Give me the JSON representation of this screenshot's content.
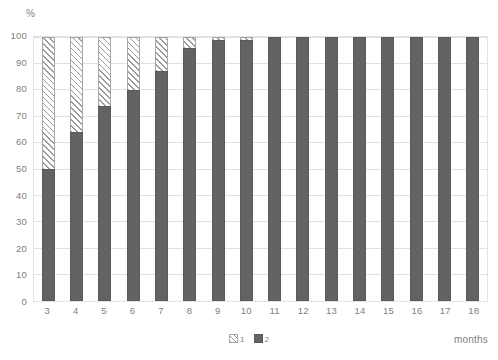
{
  "chart_data": {
    "type": "bar",
    "subtype": "stacked-100-percent",
    "title": "",
    "subtitle": "",
    "xlabel": "months",
    "ylabel": "%",
    "ylim": [
      0,
      100
    ],
    "yticks": [
      0,
      10,
      20,
      30,
      40,
      50,
      60,
      70,
      80,
      90,
      100
    ],
    "ytick_labels": [
      "0",
      "10",
      "20",
      "30",
      "40",
      "50",
      "60",
      "70",
      "80",
      "90",
      "100"
    ],
    "grid": "horizontal",
    "legend_position": "bottom-center",
    "categories": [
      "3",
      "4",
      "5",
      "6",
      "7",
      "8",
      "9",
      "10",
      "11",
      "12",
      "13",
      "14",
      "15",
      "16",
      "17",
      "18"
    ],
    "series": [
      {
        "name": "2",
        "style": "solid",
        "color": "#636363",
        "values": [
          50,
          64,
          74,
          80,
          87,
          96,
          99,
          99,
          100,
          100,
          100,
          100,
          100,
          100,
          100,
          100
        ]
      },
      {
        "name": "1",
        "style": "diagonal-hatch",
        "color": "#ffffff",
        "hatch_color": "#9a9a9a",
        "values": [
          50,
          36,
          26,
          20,
          13,
          4,
          1,
          1,
          0,
          0,
          0,
          0,
          0,
          0,
          0,
          0
        ]
      }
    ],
    "legend": [
      {
        "label": "1",
        "swatch": "diagonal-hatch"
      },
      {
        "label": "2",
        "swatch": "solid"
      }
    ],
    "colors": {
      "series_1_fill": "#ffffff",
      "series_1_hatch": "#9a9a9a",
      "series_2_fill": "#636363",
      "gridline": "#e0e0e0",
      "border": "#e3e3e3",
      "text": "#7f7f7f"
    }
  }
}
